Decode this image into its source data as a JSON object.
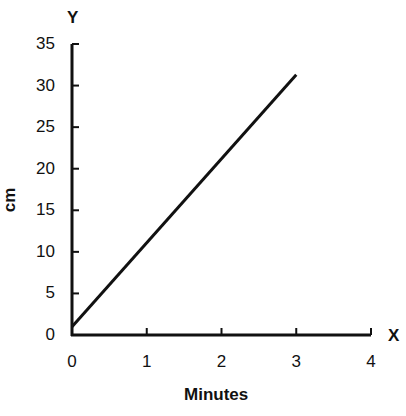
{
  "chart_data": {
    "type": "line",
    "title": "",
    "xlabel": "Minutes",
    "ylabel": "cm",
    "x_axis_letter": "X",
    "y_axis_letter": "Y",
    "xlim": [
      0,
      4
    ],
    "ylim": [
      0,
      35
    ],
    "x_ticks": [
      "0",
      "1",
      "2",
      "3",
      "4"
    ],
    "y_ticks": [
      "0",
      "5",
      "10",
      "15",
      "20",
      "25",
      "30",
      "35"
    ],
    "grid": false,
    "legend": null,
    "series": [
      {
        "name": "distance",
        "x": [
          0,
          3
        ],
        "y": [
          1,
          31.3
        ],
        "color": "#111111"
      }
    ]
  }
}
